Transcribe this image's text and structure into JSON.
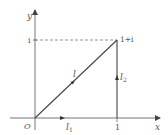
{
  "diagram": {
    "axes": {
      "x_label": "x",
      "y_label": "y",
      "origin_label": "O"
    },
    "ticks": {
      "x_one": "1",
      "y_i": "i"
    },
    "point_label": "1+i",
    "paths": {
      "l": {
        "label": "l",
        "sub": ""
      },
      "l1": {
        "label": "l",
        "sub": "1"
      },
      "l2": {
        "label": "l",
        "sub": "2"
      }
    },
    "colors": {
      "line": "#444444",
      "dashed": "#777777",
      "text": "#555555"
    }
  }
}
